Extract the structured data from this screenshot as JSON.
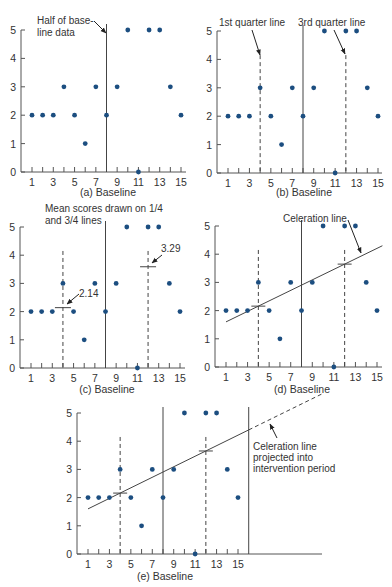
{
  "chart_data": [
    {
      "id": "a",
      "type": "scatter",
      "caption": "(a) Baseline",
      "x": [
        1,
        2,
        3,
        4,
        5,
        6,
        7,
        8,
        9,
        10,
        11,
        12,
        13,
        14,
        15
      ],
      "values": [
        2,
        2,
        2,
        3,
        2,
        1,
        3,
        2,
        3,
        5,
        0,
        5,
        5,
        3,
        2
      ],
      "xticks": [
        1,
        3,
        5,
        7,
        9,
        11,
        13,
        15
      ],
      "yticks": [
        0,
        1,
        2,
        3,
        4,
        5
      ],
      "xlim": [
        0,
        15.5
      ],
      "ylim": [
        0,
        5
      ],
      "vertical_lines": [
        {
          "x": 8,
          "style": "solid"
        }
      ],
      "annotations": [
        {
          "text": "Half of base-\nline data",
          "points_to": "top of x=8 line"
        }
      ]
    },
    {
      "id": "b",
      "type": "scatter",
      "caption": "(b) Baseline",
      "x": [
        1,
        2,
        3,
        4,
        5,
        6,
        7,
        8,
        9,
        10,
        11,
        12,
        13,
        14,
        15
      ],
      "values": [
        2,
        2,
        2,
        3,
        2,
        1,
        3,
        2,
        3,
        5,
        0,
        5,
        5,
        3,
        2
      ],
      "xticks": [
        1,
        3,
        5,
        7,
        9,
        11,
        13,
        15
      ],
      "yticks": [
        0,
        1,
        2,
        3,
        4,
        5
      ],
      "vertical_lines": [
        {
          "x": 4,
          "style": "dashed"
        },
        {
          "x": 8,
          "style": "solid"
        },
        {
          "x": 12,
          "style": "dashed"
        }
      ],
      "annotations": [
        {
          "text": "1st quarter line"
        },
        {
          "text": "3rd quarter line"
        }
      ]
    },
    {
      "id": "c",
      "type": "scatter",
      "caption": "(c) Baseline",
      "x": [
        1,
        2,
        3,
        4,
        5,
        6,
        7,
        8,
        9,
        10,
        11,
        12,
        13,
        14,
        15
      ],
      "values": [
        2,
        2,
        2,
        3,
        2,
        1,
        3,
        2,
        3,
        5,
        0,
        5,
        5,
        3,
        2
      ],
      "xticks": [
        1,
        3,
        5,
        7,
        9,
        11,
        13,
        15
      ],
      "yticks": [
        0,
        1,
        2,
        3,
        4,
        5
      ],
      "vertical_lines": [
        {
          "x": 4,
          "style": "dashed"
        },
        {
          "x": 8,
          "style": "solid"
        },
        {
          "x": 12,
          "style": "dashed"
        }
      ],
      "mean_marks": [
        {
          "x": 4,
          "y": 2.14,
          "label": "2.14"
        },
        {
          "x": 12,
          "y": 3.29,
          "label": "3.29"
        }
      ],
      "annotations": [
        {
          "text": "Mean scores drawn on 1/4\nand 3/4 lines"
        }
      ]
    },
    {
      "id": "d",
      "type": "scatter",
      "caption": "(d) Baseline",
      "x": [
        1,
        2,
        3,
        4,
        5,
        6,
        7,
        8,
        9,
        10,
        11,
        12,
        13,
        14,
        15
      ],
      "values": [
        2,
        2,
        2,
        3,
        2,
        1,
        3,
        2,
        3,
        5,
        0,
        5,
        5,
        3,
        2
      ],
      "xticks": [
        1,
        3,
        5,
        7,
        9,
        11,
        13,
        15
      ],
      "yticks": [
        0,
        1,
        2,
        3,
        4,
        5
      ],
      "vertical_lines": [
        {
          "x": 4,
          "style": "dashed"
        },
        {
          "x": 8,
          "style": "solid"
        },
        {
          "x": 12,
          "style": "dashed"
        }
      ],
      "trend_line": {
        "x0": 1,
        "y0": 1.6,
        "x1": 15.5,
        "y1": 4.3
      },
      "annotations": [
        {
          "text": "Celeration line"
        }
      ]
    },
    {
      "id": "e",
      "type": "scatter",
      "caption": "(e) Baseline",
      "x": [
        1,
        2,
        3,
        4,
        5,
        6,
        7,
        8,
        9,
        10,
        11,
        12,
        13,
        14,
        15
      ],
      "values": [
        2,
        2,
        2,
        3,
        2,
        1,
        3,
        2,
        3,
        5,
        0,
        5,
        5,
        3,
        2
      ],
      "xticks": [
        1,
        3,
        5,
        7,
        9,
        11,
        13,
        15
      ],
      "yticks": [
        0,
        1,
        2,
        3,
        4,
        5
      ],
      "vertical_lines": [
        {
          "x": 4,
          "style": "dashed"
        },
        {
          "x": 8,
          "style": "solid"
        },
        {
          "x": 12,
          "style": "dashed"
        },
        {
          "x": 16,
          "style": "solid"
        }
      ],
      "trend_line": {
        "x0": 1,
        "y0": 1.6,
        "x1": 16,
        "y1": 4.4,
        "projected_to": 23
      },
      "annotations": [
        {
          "text": "Celeration line\nprojected into\nintervention period"
        }
      ]
    }
  ],
  "labels": {
    "a_caption": "(a) Baseline",
    "b_caption": "(b) Baseline",
    "c_caption": "(c) Baseline",
    "d_caption": "(d) Baseline",
    "e_caption": "(e) Baseline",
    "a_ann_1": "Half of base-",
    "a_ann_2": "line data",
    "b_ann_1": "1st quarter line",
    "b_ann_2": "3rd quarter line",
    "c_ann_1": "Mean scores drawn on 1/4",
    "c_ann_2": "and 3/4 lines",
    "c_mean_1": "2.14",
    "c_mean_2": "3.29",
    "d_ann": "Celeration line",
    "e_ann_1": "Celeration line",
    "e_ann_2": "projected into",
    "e_ann_3": "intervention period"
  }
}
